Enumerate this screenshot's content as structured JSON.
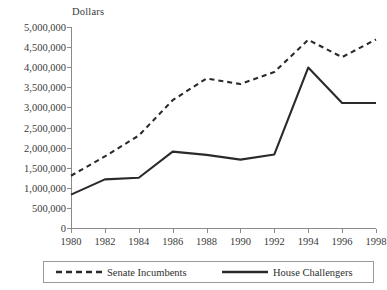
{
  "chart_data": {
    "type": "line",
    "title": "",
    "subtitle": "",
    "xlabel": "",
    "ylabel": "Dollars",
    "ylim": [
      0,
      5000000
    ],
    "ytick_labels": [
      "0",
      "500,000",
      "1,000,000",
      "1,500,000",
      "2,000,000",
      "2,500,000",
      "3,000,000",
      "3,500,000",
      "4,000,000",
      "4,500,000",
      "5,000,000"
    ],
    "ytick_values": [
      0,
      500000,
      1000000,
      1500000,
      2000000,
      2500000,
      3000000,
      3500000,
      4000000,
      4500000,
      5000000
    ],
    "grid": false,
    "legend_position": "bottom",
    "x": [
      1980,
      1982,
      1984,
      1986,
      1988,
      1990,
      1992,
      1994,
      1996,
      1998
    ],
    "categories": [
      "1980",
      "1982",
      "1984",
      "1986",
      "1988",
      "1990",
      "1992",
      "1994",
      "1996",
      "1998"
    ],
    "series": [
      {
        "name": "Senate Incumbents",
        "style": "dashed",
        "color": "#2a2a2a",
        "values": [
          1300000,
          1780000,
          2300000,
          3180000,
          3720000,
          3580000,
          3880000,
          4680000,
          4250000,
          4690000
        ]
      },
      {
        "name": "House Challengers",
        "style": "solid",
        "color": "#2a2a2a",
        "values": [
          830000,
          1210000,
          1250000,
          1900000,
          1820000,
          1700000,
          1830000,
          3990000,
          3110000,
          3110000
        ]
      }
    ]
  },
  "axis": {
    "y_title": "Dollars"
  },
  "legend": {
    "items": [
      {
        "label": "Senate Incumbents",
        "style": "dashed"
      },
      {
        "label": "House Challengers",
        "style": "solid"
      }
    ]
  },
  "colors": {
    "line": "#2a2a2a",
    "axis": "#8a8a8a",
    "text": "#3a3a3a",
    "legend_border": "#9a9a9a",
    "background": "#ffffff"
  }
}
